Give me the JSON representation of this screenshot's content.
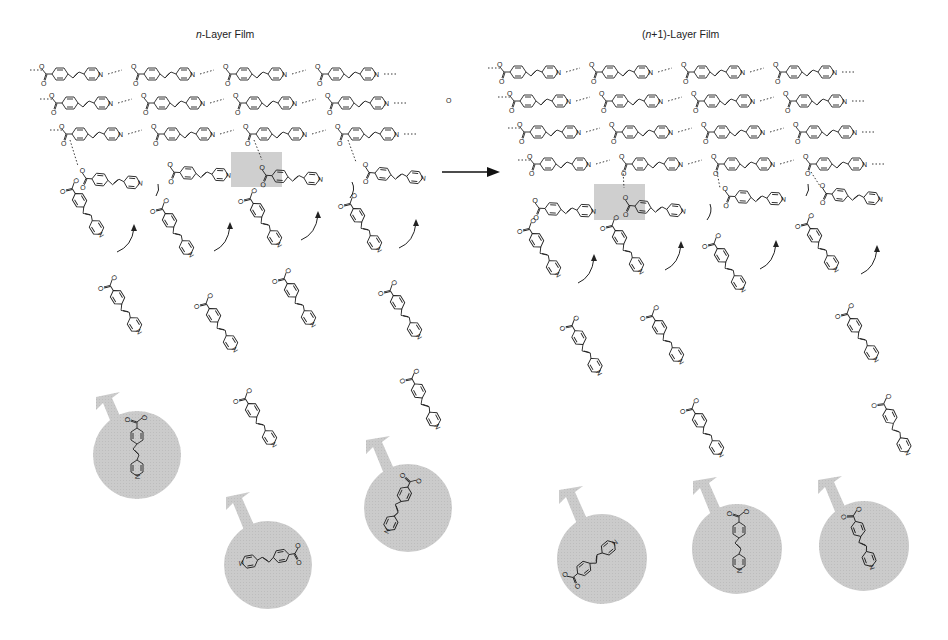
{
  "panels": [
    {
      "id": "left",
      "title_prefix": "n",
      "title_suffix": "-Layer Film"
    },
    {
      "id": "right",
      "title_prefix": "(n+1)",
      "title_suffix": "-Layer Film"
    }
  ],
  "titles": {
    "left_italic": "n",
    "left_rest": "-Layer Film",
    "right_open": "(",
    "right_italic": "n",
    "right_rest": "+1)-Layer Film"
  },
  "molecule": {
    "name": "4-[2-(4-pyridyl)vinyl]benzoic acid",
    "atom_labels": [
      "O",
      "O",
      "H",
      "N"
    ]
  },
  "process_arrow": {
    "direction": "left-to-right",
    "meaning": "layer growth"
  },
  "stray_label": "O",
  "left_panel": {
    "horizontal_rows": 3,
    "molecules_per_row": 4,
    "diagonal_chains": 4,
    "highlight_box": "H-bond exchange site",
    "free_molecules_in_circles": 3
  },
  "right_panel": {
    "horizontal_rows": 4,
    "molecules_per_row": 4,
    "diagonal_chains": 4,
    "highlight_box": "H-bond exchange site",
    "free_molecules_in_circles": 3
  },
  "colors": {
    "line": "#222222",
    "circle_fill": "#c8c8c8",
    "highlight": "#cfcfcf",
    "background": "#ffffff"
  }
}
